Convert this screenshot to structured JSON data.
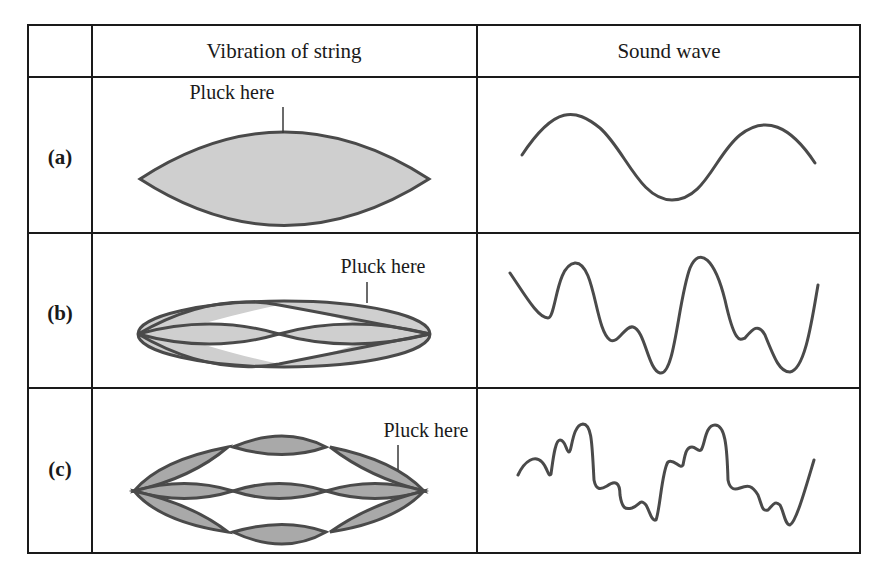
{
  "table": {
    "headers": [
      "",
      "Vibration of string",
      "Sound wave"
    ],
    "rows": [
      {
        "label": "(a)",
        "annotation": "Pluck here",
        "string_mode": "fundamental",
        "wave": "pure sine"
      },
      {
        "label": "(b)",
        "annotation": "Pluck here",
        "string_mode": "fundamental + 2nd harmonic",
        "wave": "complex"
      },
      {
        "label": "(c)",
        "annotation": "Pluck here",
        "string_mode": "fundamental + 2nd + 3rd harmonics",
        "wave": "more complex"
      }
    ]
  },
  "colors": {
    "border": "#1a1a1a",
    "outline": "#4a4a4a",
    "light_fill": "#cfcfcf",
    "dark_fill": "#a9a9a9"
  }
}
